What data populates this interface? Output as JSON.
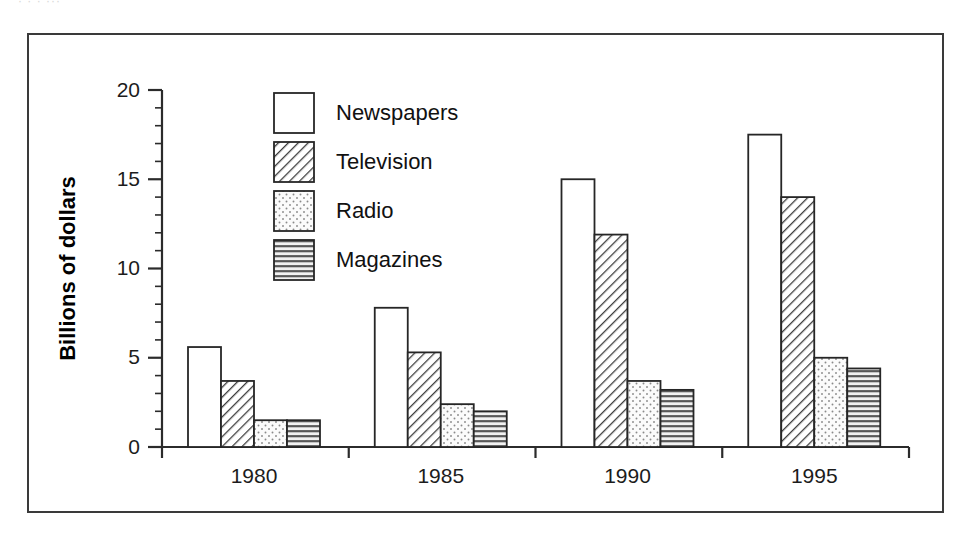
{
  "scan": {
    "top_fragment": "· ·   ·  ···"
  },
  "figure": {
    "frame_color": "#3a3a3a",
    "background": "#ffffff",
    "ink_color": "#262626"
  },
  "axis": {
    "y_title": "Billions of dollars",
    "y_ticks": [
      "0",
      "5",
      "10",
      "15",
      "20"
    ],
    "x_ticks": [
      "1980",
      "1985",
      "1990",
      "1995"
    ]
  },
  "legend": {
    "items": [
      {
        "label": "Newspapers",
        "pattern": "solid-white",
        "icon": "legend-swatch-newspapers"
      },
      {
        "label": "Television",
        "pattern": "diagonal-hatch",
        "icon": "legend-swatch-television"
      },
      {
        "label": "Radio",
        "pattern": "dotted",
        "icon": "legend-swatch-radio"
      },
      {
        "label": "Magazines",
        "pattern": "horizontal-lines",
        "icon": "legend-swatch-magazines"
      }
    ]
  },
  "chart_data": {
    "type": "bar",
    "title": "",
    "xlabel": "",
    "ylabel": "Billions of dollars",
    "categories": [
      "1980",
      "1985",
      "1990",
      "1995"
    ],
    "ylim": [
      0,
      20
    ],
    "ytick_values": [
      0,
      5,
      10,
      15,
      20
    ],
    "yminor_step": 1,
    "grid": false,
    "legend_position": "upper-left-inside",
    "series": [
      {
        "name": "Newspapers",
        "pattern": "solid-white",
        "values": [
          5.6,
          7.8,
          15.0,
          17.5
        ]
      },
      {
        "name": "Television",
        "pattern": "diagonal-hatch",
        "values": [
          3.7,
          5.3,
          11.9,
          14.0
        ]
      },
      {
        "name": "Radio",
        "pattern": "dotted",
        "values": [
          1.5,
          2.4,
          3.7,
          5.0
        ]
      },
      {
        "name": "Magazines",
        "pattern": "horizontal-lines",
        "values": [
          1.5,
          2.0,
          3.2,
          4.4
        ]
      }
    ]
  }
}
